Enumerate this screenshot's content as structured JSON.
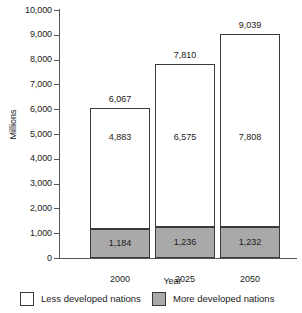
{
  "chart_data": {
    "type": "bar",
    "subtype": "stacked",
    "title": "",
    "xlabel": "Year",
    "ylabel": "Millions",
    "ylim": [
      0,
      10000
    ],
    "ytick_values": [
      0,
      1000,
      2000,
      3000,
      4000,
      5000,
      6000,
      7000,
      8000,
      9000,
      10000
    ],
    "ytick_labels": [
      "0",
      "1,000",
      "2,000",
      "3,000",
      "4,000",
      "5,000",
      "6,000",
      "7,000",
      "8,000",
      "9,000",
      "10,000"
    ],
    "grid": false,
    "legend_position": "bottom",
    "categories": [
      "2000",
      "2025",
      "2050"
    ],
    "series": [
      {
        "name": "More developed nations",
        "color": "#a9a9a9",
        "values": [
          1184,
          1232,
          1232
        ],
        "labels": [
          "1,184",
          "1,236",
          "1,232"
        ]
      },
      {
        "name": "Less developed nations",
        "color": "#ffffff",
        "values": [
          4883,
          6575,
          7808
        ],
        "labels": [
          "4,883",
          "6,575",
          "7,808"
        ]
      }
    ],
    "totals": [
      6067,
      7810,
      9039
    ],
    "total_labels": [
      "6,067",
      "7,810",
      "9,039"
    ]
  },
  "axis": {
    "y_title": "Millions",
    "x_title": "Year",
    "y_ticks": [
      {
        "label": "10,000",
        "value": 10000
      },
      {
        "label": "9,000",
        "value": 9000
      },
      {
        "label": "8,000",
        "value": 8000
      },
      {
        "label": "7,000",
        "value": 7000
      },
      {
        "label": "6,000",
        "value": 6000
      },
      {
        "label": "5,000",
        "value": 5000
      },
      {
        "label": "4,000",
        "value": 4000
      },
      {
        "label": "3,000",
        "value": 3000
      },
      {
        "label": "2,000",
        "value": 2000
      },
      {
        "label": "1,000",
        "value": 1000
      },
      {
        "label": "0",
        "value": 0
      }
    ]
  },
  "bars": [
    {
      "category": "2000",
      "total_label": "6,067",
      "upper_label": "4,883",
      "lower_label": "1,184",
      "total": 6067,
      "lower": 1184
    },
    {
      "category": "2025",
      "total_label": "7,810",
      "upper_label": "6,575",
      "lower_label": "1,236",
      "total": 7810,
      "lower": 1232
    },
    {
      "category": "2050",
      "total_label": "9,039",
      "upper_label": "7,808",
      "lower_label": "1,232",
      "total": 9039,
      "lower": 1232
    }
  ],
  "legend": {
    "items": [
      {
        "label": "Less developed nations",
        "swatch": "light"
      },
      {
        "label": "More developed nations",
        "swatch": "dark"
      }
    ]
  }
}
